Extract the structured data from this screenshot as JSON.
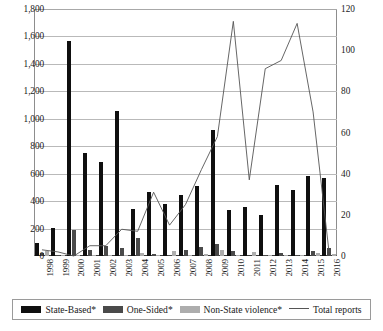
{
  "chart_data": {
    "type": "bar",
    "title": "",
    "subtitle": "",
    "xlabel": "",
    "ylabel": "",
    "categories": [
      "1998",
      "1999",
      "2000",
      "2001",
      "2002",
      "2003",
      "2004",
      "2005",
      "2006",
      "2007",
      "2008",
      "2009",
      "2010",
      "2011",
      "2012",
      "2013",
      "2014",
      "2015",
      "2016"
    ],
    "grid": true,
    "legend_position": "bottom",
    "axes": {
      "left": {
        "label": "",
        "ylim": [
          0,
          1800
        ],
        "ticks": [
          "0",
          "200",
          "400",
          "600",
          "800",
          "1,000",
          "1,200",
          "1,400",
          "1,600",
          "1,800"
        ],
        "tick_values": [
          0,
          200,
          400,
          600,
          800,
          1000,
          1200,
          1400,
          1600,
          1800
        ]
      },
      "right": {
        "label": "",
        "ylim": [
          0,
          120
        ],
        "ticks": [
          "0",
          "20",
          "40",
          "60",
          "80",
          "100",
          "120"
        ],
        "tick_values": [
          0,
          20,
          40,
          60,
          80,
          100,
          120
        ]
      }
    },
    "series": [
      {
        "name": "State-Based*",
        "kind": "bar",
        "axis": "left",
        "color": "#0f0f0f",
        "values": [
          95,
          205,
          1570,
          750,
          685,
          1055,
          340,
          470,
          380,
          445,
          510,
          915,
          335,
          355,
          300,
          520,
          480,
          580,
          565
        ]
      },
      {
        "name": "One-Sided*",
        "kind": "bar",
        "axis": "left",
        "color": "#4a4a4a",
        "values": [
          20,
          5,
          190,
          45,
          75,
          60,
          130,
          15,
          10,
          45,
          65,
          90,
          35,
          0,
          5,
          20,
          10,
          40,
          60
        ]
      },
      {
        "name": "Non-State violence*",
        "kind": "bar",
        "axis": "left",
        "color": "#adadad",
        "values": [
          40,
          5,
          10,
          5,
          10,
          5,
          20,
          10,
          35,
          10,
          15,
          45,
          5,
          30,
          5,
          5,
          5,
          20,
          15
        ]
      },
      {
        "name": "Total reports",
        "kind": "line",
        "axis": "right",
        "color": "#555555",
        "values": [
          3,
          2,
          0,
          5,
          5,
          13,
          12,
          31,
          15,
          25,
          42,
          58,
          114,
          37,
          91,
          95,
          113,
          70,
          2
        ]
      }
    ]
  },
  "legend": {
    "items": [
      {
        "label": "State-Based*",
        "marker": "swatch-dark"
      },
      {
        "label": "One-Sided*",
        "marker": "swatch-mid"
      },
      {
        "label": "Non-State violence*",
        "marker": "swatch-light"
      },
      {
        "label": "Total reports",
        "marker": "line"
      }
    ]
  }
}
